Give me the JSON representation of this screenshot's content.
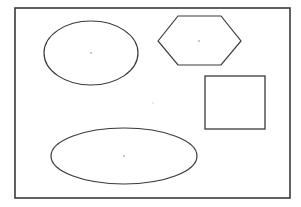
{
  "canvas": {
    "width": 301,
    "height": 207,
    "background": "#ffffff",
    "stroke_color": "#3a3a3a",
    "center_dot_color": "#b0b0b0"
  },
  "frame": {
    "x": 15,
    "y": 8,
    "width": 275,
    "height": 190
  },
  "shapes": [
    {
      "type": "ellipse",
      "name": "top-left-ellipse",
      "cx": 91,
      "cy": 53,
      "rx": 47,
      "ry": 32
    },
    {
      "type": "hexagon",
      "name": "hexagon",
      "points": "158,41 178,16 221,16 241,41 221,65 178,65",
      "cx": 199,
      "cy": 41
    },
    {
      "type": "rect",
      "name": "square",
      "x": 205,
      "y": 76,
      "width": 60,
      "height": 53
    },
    {
      "type": "ellipse",
      "name": "bottom-ellipse",
      "cx": 124,
      "cy": 156,
      "rx": 73,
      "ry": 28
    }
  ],
  "stray_dot": {
    "cx": 153,
    "cy": 103
  }
}
